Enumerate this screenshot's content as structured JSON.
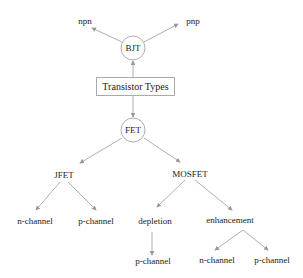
{
  "diagram": {
    "root": "Transistor Types",
    "nodes": {
      "bjt": "BJT",
      "npn": "npn",
      "pnp": "pnp",
      "fet": "FET",
      "jfet": "JFET",
      "mosfet": "MOSFET",
      "jfet_n": "n-channel",
      "jfet_p": "p-channel",
      "depletion": "depletion",
      "enhancement": "enhancement",
      "depletion_p": "p-channel",
      "enh_n": "n-channel",
      "enh_p": "p-channel"
    },
    "edges": [
      [
        "Transistor Types",
        "BJT"
      ],
      [
        "BJT",
        "npn"
      ],
      [
        "BJT",
        "pnp"
      ],
      [
        "Transistor Types",
        "FET"
      ],
      [
        "FET",
        "JFET"
      ],
      [
        "FET",
        "MOSFET"
      ],
      [
        "JFET",
        "n-channel"
      ],
      [
        "JFET",
        "p-channel"
      ],
      [
        "MOSFET",
        "depletion"
      ],
      [
        "MOSFET",
        "enhancement"
      ],
      [
        "depletion",
        "p-channel"
      ],
      [
        "enhancement",
        "n-channel"
      ],
      [
        "enhancement",
        "p-channel"
      ]
    ]
  }
}
